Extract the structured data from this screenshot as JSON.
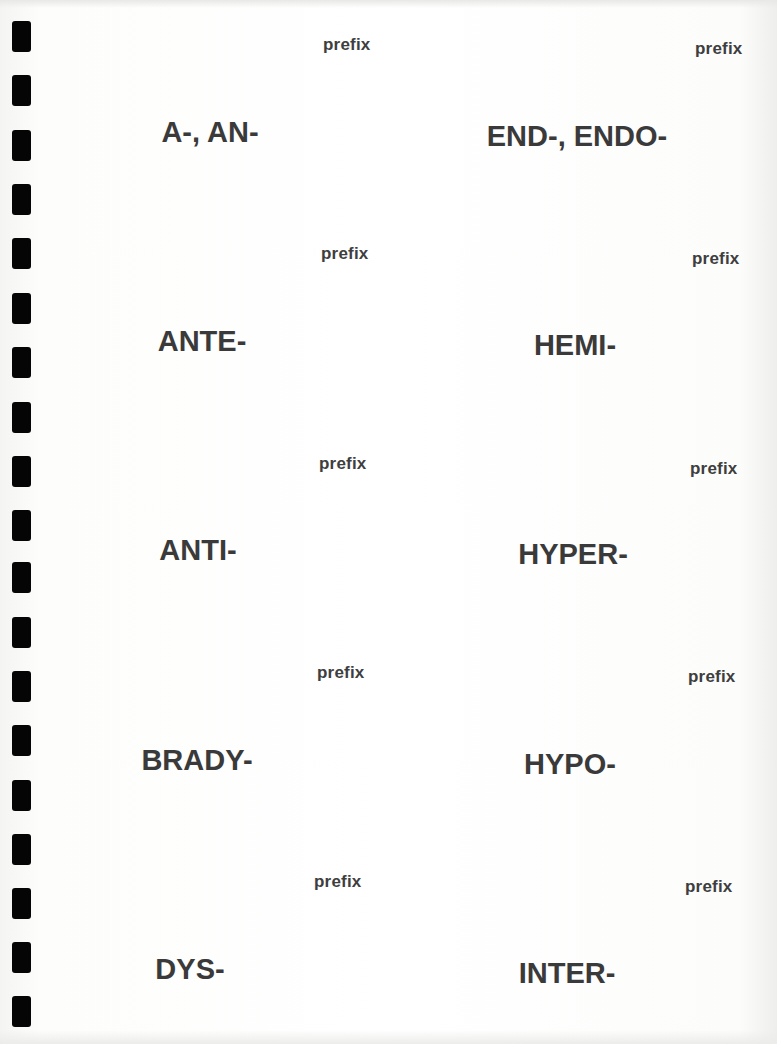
{
  "document": {
    "type": "flashcard-sheet",
    "subject": "medical terminology prefixes"
  },
  "colors": {
    "text": "#3a3a3a",
    "hole": "#050505",
    "paper": "#ffffff"
  },
  "punch_holes": {
    "count": 19
  },
  "cards": [
    {
      "label": "prefix",
      "term": "A-, AN-"
    },
    {
      "label": "prefix",
      "term": "END-, ENDO-"
    },
    {
      "label": "prefix",
      "term": "ANTE-"
    },
    {
      "label": "prefix",
      "term": "HEMI-"
    },
    {
      "label": "prefix",
      "term": "ANTI-"
    },
    {
      "label": "prefix",
      "term": "HYPER-"
    },
    {
      "label": "prefix",
      "term": "BRADY-"
    },
    {
      "label": "prefix",
      "term": "HYPO-"
    },
    {
      "label": "prefix",
      "term": "DYS-"
    },
    {
      "label": "prefix",
      "term": "INTER-"
    }
  ]
}
